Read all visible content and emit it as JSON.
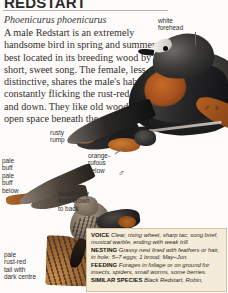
{
  "page": {
    "title": "REDSTART",
    "scientific_name": "Phoenicurus phoenicurus",
    "intro": "A male Redstart is an extremely handsome bird in spring and summer, best located in its breeding wood by its short, sweet song. The female, less distinctive, shares the male's habit of constantly flicking the rust-red tail up and down. They like old woods with open space beneath the canopy."
  },
  "labels": {
    "white_forehead": "white\nforehead",
    "rusty_rump": "rusty\nrump",
    "orange_rufous_below": "orange-\nrufous\nbelow",
    "pale_buff": "pale\nbuff",
    "pale_buff_below": "pale\nbuff\nbelow",
    "bluish_grey": "bluish grey\nfrom crown\nto back",
    "pale_rust_tail": "pale\nrust-red\ntail with\ndark centre"
  },
  "symbols": {
    "male": "♂",
    "female": "♀"
  },
  "infobox": {
    "entries": [
      {
        "heading": "VOICE",
        "text": "Clear, rising wheet, sharp tac; song brief, musical warble, ending with weak trill."
      },
      {
        "heading": "NESTING",
        "text": "Grassy nest lined with feathers or hair, in hole; 5–7 eggs; 1 brood; May–Jun."
      },
      {
        "heading": "FEEDING",
        "text": "Forages in foliage or on ground for insects, spiders, small worms, some berries."
      },
      {
        "heading": "SIMILAR SPECIES",
        "text": "Black Redstart, Robin,"
      }
    ]
  },
  "colors": {
    "infobox_bg": "#f4ecd8",
    "infobox_border": "#cfc3a3",
    "rufous": "#b8661f",
    "text": "#33302d"
  }
}
